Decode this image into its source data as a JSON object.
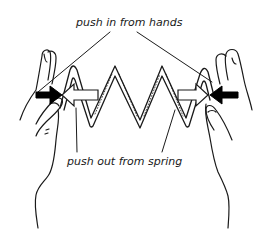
{
  "diagram": {
    "labels": {
      "top": "push in from hands",
      "bottom": "push out from spring"
    },
    "arrows": {
      "hand_push": {
        "color": "#000000",
        "direction": "inward",
        "count": 2
      },
      "spring_push": {
        "color": "#ffffff",
        "direction": "outward",
        "count": 2
      }
    },
    "colors": {
      "line": "#1a1a1a",
      "background": "#ffffff"
    }
  }
}
